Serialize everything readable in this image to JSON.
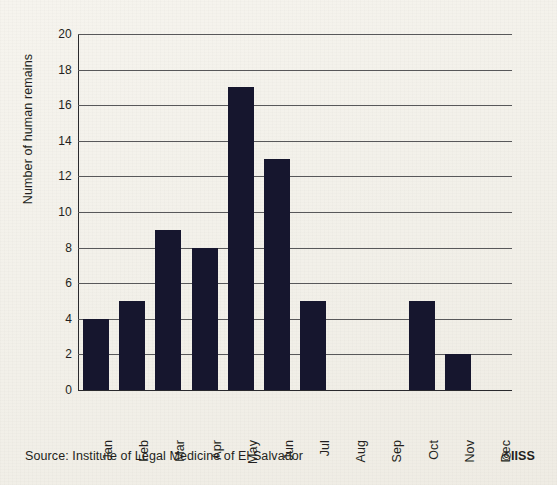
{
  "chart_data": {
    "type": "bar",
    "title": "",
    "subtitle": "",
    "xlabel": "",
    "ylabel": "Number of human remains",
    "categories": [
      "Jan",
      "Feb",
      "Mar",
      "Apr",
      "May",
      "Jun",
      "Jul",
      "Aug",
      "Sep",
      "Oct",
      "Nov",
      "Dec"
    ],
    "values": [
      4,
      5,
      9,
      8,
      17,
      13,
      5,
      0,
      0,
      5,
      2,
      0
    ],
    "ylim": [
      0,
      20
    ],
    "ytick_values": [
      0,
      2,
      4,
      6,
      8,
      10,
      12,
      14,
      16,
      18,
      20
    ],
    "ytick_labels": [
      "0",
      "2",
      "4",
      "6",
      "8",
      "10",
      "12",
      "14",
      "16",
      "18",
      "20"
    ],
    "grid": true,
    "grid_axis": "y",
    "legend": false,
    "legend_position": "none",
    "bar_color": "#16162e",
    "background_color": "#f4f2ec",
    "axis_color": "#231f20",
    "gridline_color": "#58585a"
  },
  "footer": {
    "source": "Source: Institute of Legal Medicine of El Salvador",
    "copyright": "©IISS"
  }
}
